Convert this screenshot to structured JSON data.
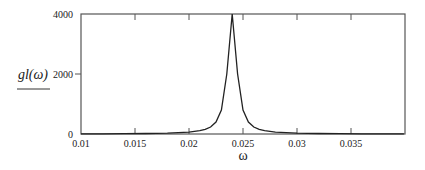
{
  "chart_data": {
    "type": "line",
    "title": "",
    "xlabel": "ω",
    "ylabel": "gl(ω)",
    "xlim": [
      0.01,
      0.04
    ],
    "ylim": [
      0,
      4000
    ],
    "grid": false,
    "legend": null,
    "x_ticks": [
      0.01,
      0.015,
      0.02,
      0.025,
      0.03,
      0.035
    ],
    "x_tick_labels": [
      "0.01",
      "0.015",
      "0.02",
      "0.025",
      "0.03",
      "0.035"
    ],
    "y_ticks": [
      0,
      2000,
      4000
    ],
    "y_tick_labels": [
      "0",
      "2000",
      "4000"
    ],
    "series": [
      {
        "name": "gl(ω)",
        "color": "#222222",
        "x": [
          0.01,
          0.012,
          0.014,
          0.016,
          0.018,
          0.019,
          0.02,
          0.021,
          0.0215,
          0.022,
          0.0225,
          0.023,
          0.0235,
          0.024,
          0.0245,
          0.025,
          0.0255,
          0.026,
          0.0265,
          0.027,
          0.028,
          0.029,
          0.03,
          0.032,
          0.034,
          0.036,
          0.038,
          0.0399
        ],
        "y": [
          5,
          7,
          10,
          16,
          28,
          42,
          65,
          114,
          158,
          235,
          400,
          800,
          2000,
          4000,
          2000,
          800,
          400,
          235,
          158,
          114,
          65,
          42,
          28,
          16,
          10,
          7,
          5,
          4
        ]
      }
    ]
  }
}
